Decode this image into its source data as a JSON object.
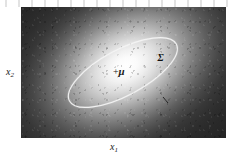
{
  "figure": {
    "type": "gaussian-density-heatmap-with-covariance-ellipse",
    "caption": "",
    "background_color": "#ffffff",
    "panel_color": "#242424"
  },
  "axes": {
    "x_axis": {
      "label": "x",
      "subscript": "1",
      "position": "bottom"
    },
    "y_axis": {
      "label": "x",
      "subscript": "2",
      "position": "left"
    }
  },
  "annotations": {
    "mean": {
      "marker": "+",
      "symbol": "μ",
      "name": "mean-marker",
      "description": "mean of the Gaussian"
    },
    "covariance": {
      "symbol": "Σ",
      "name": "covariance-label",
      "description": "covariance contour"
    }
  },
  "chart_data": {
    "type": "heatmap",
    "title": "",
    "subtitle": "",
    "xlabel": "x1",
    "ylabel": "x2",
    "grid": false,
    "legend": null,
    "density": {
      "distribution": "bivariate-gaussian",
      "mean": [
        0.5,
        0.5
      ],
      "peak_color": "#ffffff",
      "floor_color": "#242424",
      "orientation_deg": -28,
      "sigma_major": 0.33,
      "sigma_minor": 0.18
    },
    "contour": {
      "name": "one-sigma-ellipse",
      "stroke_color": "#f2f2f2",
      "stroke_width": 1.1,
      "center": [
        0.497,
        0.5
      ],
      "rx": 0.295,
      "ry": 0.175,
      "rotation_deg": -28
    },
    "points": [
      {
        "label": "μ",
        "x": 0.497,
        "y": 0.5,
        "marker": "plus"
      }
    ],
    "annotations": [
      {
        "text": "Σ",
        "x": 0.7,
        "y": 0.68
      }
    ],
    "xlim": [
      0,
      1
    ],
    "ylim": [
      0,
      1
    ]
  }
}
